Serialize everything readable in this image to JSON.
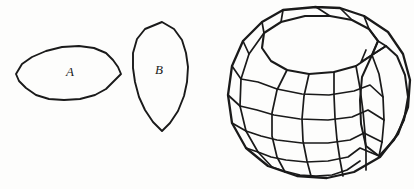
{
  "figure": {
    "background_color": "#fdfdfc",
    "ink_color": "#1a1a1a",
    "width": 414,
    "height": 189,
    "labels": {
      "a": "A",
      "b": "B"
    },
    "shapes": {
      "region_a": {
        "name": "region-a",
        "kind": "closed-polygon-outline",
        "label": "A",
        "label_x": 70,
        "label_y": 73,
        "bbox": [
          16,
          45,
          121,
          101
        ],
        "points": "16,74 22,64 32,57 46,51 62,47 79,46 94,48 106,53 113,60 118,67 121,74 114,81 106,89 95,95 80,99 64,100 49,99 36,95 26,88 19,81 16,74"
      },
      "region_b": {
        "name": "region-b",
        "kind": "closed-polygon-outline",
        "label": "B",
        "label_x": 159,
        "label_y": 71,
        "bbox": [
          132,
          22,
          189,
          131
        ],
        "points": "162,22 174,29 182,40 186,53 188,67 187,82 184,96 178,111 170,123 162,131 153,122 145,110 139,97 135,82 133,68 133,53 137,39 145,29 162,22"
      },
      "sphere": {
        "name": "gridded-sphere",
        "kind": "wireframe-sphere-with-open-cap",
        "bbox": [
          228,
          6,
          411,
          178
        ],
        "silhouette": "316,7 283,10 262,22 243,41 232,66 228,95 232,123 246,148 268,166 297,176 327,178 354,172 380,157 398,134 408,107 410,80 403,54 388,32 364,16 340,8 316,7",
        "cap_rim": "264,33 281,22 305,16 330,16 352,20 369,29 378,41 372,55 356,66 334,72 309,74 287,70 271,61 262,48 264,33",
        "lune_boundary": "372,55 386,46 397,56 405,75 408,97 404,120 394,140 379,156 366,146 361,124 360,100 362,77 372,55",
        "meridians": [
          "264,33 249,54 241,79 240,106 246,131 258,152 272,167",
          "287,70 277,90 272,113 272,136 277,157 285,172",
          "309,74 304,96 302,119 303,141 307,161 311,176",
          "334,72 334,95 335,118 337,140 340,160 343,176",
          "356,66 360,88 363,111 365,133 366,152 366,170",
          "372,55 379,74 383,97 384,120 382,142 379,156"
        ],
        "parallels": [
          "241,79 258,82 277,89 302,94 329,95 354,91 370,85 383,97",
          "240,106 257,110 274,115 300,119 328,120 352,117 368,110 384,120",
          "246,131 261,136 277,140 302,143 328,143 350,140 364,133 382,142",
          "258,152 271,157 286,160 306,162 328,161 348,157 360,148 379,156",
          "272,167 284,171 300,175 316,176 332,175 347,170 360,161"
        ],
        "cap_struts": [
          "262,22 264,33",
          "243,41 249,54",
          "232,66 241,79",
          "228,95 240,106",
          "232,123 246,131",
          "246,148 258,152",
          "268,166 272,167",
          "297,176 300,175",
          "327,178 332,175",
          "354,172 360,161",
          "380,157 379,156",
          "398,134 394,140",
          "408,107 404,120",
          "410,80 405,75",
          "403,54 397,56",
          "388,32 386,46",
          "364,16 369,29",
          "340,8 352,20",
          "316,7 330,16",
          "283,10 281,22"
        ],
        "cap_inner_facets": [
          "369,29 378,41 386,46 372,55",
          "378,41 372,55 361,62 366,50"
        ]
      }
    }
  }
}
